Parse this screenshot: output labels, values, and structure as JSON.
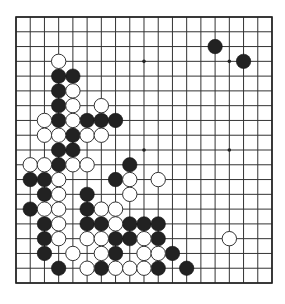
{
  "board": {
    "size": 19,
    "origin": {
      "x": 16,
      "y": 17
    },
    "spacing": {
      "x": 14.222,
      "y": 14.778
    },
    "stone_radius": 7.2,
    "colors": {
      "background": "#ffffff",
      "line": "#333333",
      "black": "#222222",
      "white": "#ffffff"
    },
    "star_points": [
      [
        3,
        3
      ],
      [
        9,
        3
      ],
      [
        15,
        3
      ],
      [
        3,
        9
      ],
      [
        9,
        9
      ],
      [
        15,
        9
      ],
      [
        3,
        15
      ],
      [
        9,
        15
      ],
      [
        15,
        15
      ]
    ],
    "black_stones": [
      [
        14,
        2
      ],
      [
        16,
        3
      ],
      [
        3,
        4
      ],
      [
        4,
        4
      ],
      [
        3,
        5
      ],
      [
        3,
        6
      ],
      [
        3,
        7
      ],
      [
        5,
        7
      ],
      [
        6,
        7
      ],
      [
        7,
        7
      ],
      [
        4,
        8
      ],
      [
        3,
        9
      ],
      [
        4,
        9
      ],
      [
        3,
        10
      ],
      [
        8,
        10
      ],
      [
        1,
        11
      ],
      [
        2,
        11
      ],
      [
        7,
        11
      ],
      [
        2,
        12
      ],
      [
        5,
        12
      ],
      [
        1,
        13
      ],
      [
        5,
        13
      ],
      [
        2,
        14
      ],
      [
        5,
        14
      ],
      [
        6,
        14
      ],
      [
        8,
        14
      ],
      [
        9,
        14
      ],
      [
        10,
        14
      ],
      [
        2,
        15
      ],
      [
        7,
        15
      ],
      [
        8,
        15
      ],
      [
        10,
        15
      ],
      [
        2,
        16
      ],
      [
        7,
        16
      ],
      [
        11,
        16
      ],
      [
        3,
        17
      ],
      [
        6,
        17
      ],
      [
        10,
        17
      ],
      [
        12,
        17
      ]
    ],
    "white_stones": [
      [
        3,
        3
      ],
      [
        4,
        5
      ],
      [
        4,
        6
      ],
      [
        6,
        6
      ],
      [
        2,
        7
      ],
      [
        4,
        7
      ],
      [
        2,
        8
      ],
      [
        3,
        8
      ],
      [
        5,
        8
      ],
      [
        6,
        8
      ],
      [
        1,
        10
      ],
      [
        2,
        10
      ],
      [
        4,
        10
      ],
      [
        5,
        10
      ],
      [
        3,
        11
      ],
      [
        8,
        11
      ],
      [
        10,
        11
      ],
      [
        3,
        12
      ],
      [
        8,
        12
      ],
      [
        2,
        13
      ],
      [
        3,
        13
      ],
      [
        6,
        13
      ],
      [
        7,
        13
      ],
      [
        3,
        14
      ],
      [
        7,
        14
      ],
      [
        3,
        15
      ],
      [
        5,
        15
      ],
      [
        6,
        15
      ],
      [
        9,
        15
      ],
      [
        15,
        15
      ],
      [
        4,
        16
      ],
      [
        6,
        16
      ],
      [
        9,
        16
      ],
      [
        10,
        16
      ],
      [
        5,
        17
      ],
      [
        7,
        17
      ],
      [
        8,
        17
      ],
      [
        9,
        17
      ]
    ]
  }
}
